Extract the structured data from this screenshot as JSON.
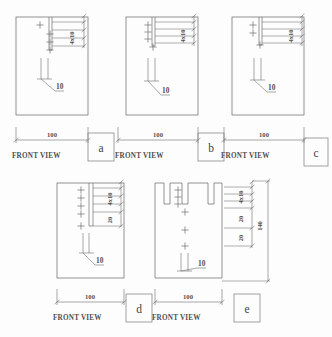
{
  "drawing": {
    "title": "Front view variants with hole pattern dimensions",
    "line_color": "#6e6e6e",
    "text_color": "#4f4f4f",
    "background": "#fdfdfd",
    "common": {
      "view_label": "FRONT VIEW",
      "width_dim": "100",
      "hole_note": "10",
      "hole_pattern": "4x10"
    },
    "panels": [
      {
        "id": "a",
        "letter": "a",
        "view_label": "FRONT VIEW",
        "width_dim": "100",
        "hole_note": "10",
        "vertical_dims": [
          "4x10"
        ],
        "slot_count": 1,
        "centermark_count": 4
      },
      {
        "id": "b",
        "letter": "b",
        "view_label": "FRONT VIEW",
        "width_dim": "100",
        "hole_note": "10",
        "vertical_dims": [
          "4x10"
        ],
        "slot_count": 1,
        "centermark_count": 4
      },
      {
        "id": "c",
        "letter": "c",
        "view_label": "FRONT VIEW",
        "width_dim": "100",
        "hole_note": "10",
        "vertical_dims": [
          "4x10"
        ],
        "slot_count": 1,
        "centermark_count": 3
      },
      {
        "id": "d",
        "letter": "d",
        "view_label": "FRONT VIEW",
        "width_dim": "100",
        "hole_note": "10",
        "vertical_dims": [
          "4x10",
          "20"
        ],
        "slot_count": 1,
        "centermark_count": 5
      },
      {
        "id": "e",
        "letter": "e",
        "view_label": "FRONT VIEW",
        "width_dim": "100",
        "hole_note": "10",
        "vertical_dims": [
          "4x10",
          "20",
          "20"
        ],
        "overall_height_dim": "140",
        "slot_count": 3,
        "centermark_count": 6
      }
    ]
  }
}
